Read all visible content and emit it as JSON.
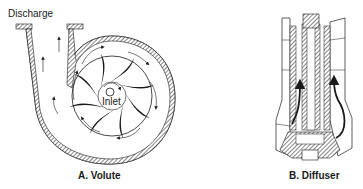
{
  "figure": {
    "panels": [
      {
        "id": "A",
        "caption": "A. Volute",
        "labels": {
          "discharge": "Discharge",
          "inlet": "Inlet"
        }
      },
      {
        "id": "B",
        "caption": "B. Diffuser"
      }
    ],
    "colors": {
      "line": "#1a1a1a",
      "hatch": "#777777",
      "background": "#ffffff"
    }
  }
}
